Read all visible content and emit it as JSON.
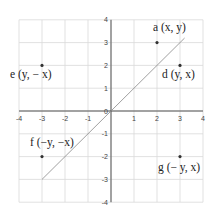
{
  "chart_data": {
    "type": "scatter",
    "title": "",
    "xlabel": "",
    "ylabel": "",
    "xlim": [
      -4,
      4
    ],
    "ylim": [
      -4,
      4
    ],
    "grid": true,
    "x_ticks": [
      "-4",
      "-3",
      "-2",
      "-1",
      "0",
      "1",
      "2",
      "3",
      "4"
    ],
    "y_ticks": [
      "4",
      "3",
      "2",
      "1",
      "0",
      "-1",
      "-2",
      "-3",
      "-4"
    ],
    "line": {
      "label": "y = x",
      "from": [
        -3,
        -3
      ],
      "to": [
        3.2,
        3.2
      ],
      "color": "#888888"
    },
    "points": [
      {
        "id": "a",
        "label": "a (x, y)",
        "x": 2,
        "y": 3
      },
      {
        "id": "d",
        "label": "d (y, x)",
        "x": 3,
        "y": 2
      },
      {
        "id": "e",
        "label": "e (y, − x)",
        "x": -3,
        "y": 2
      },
      {
        "id": "f",
        "label": "f (−y, −x)",
        "x": -3,
        "y": -2
      },
      {
        "id": "g",
        "label": "g (− y, x)",
        "x": 3,
        "y": -2
      }
    ],
    "colors": {
      "grid": "#d9d9d9",
      "axis": "#555555",
      "point": "#333333",
      "text": "#222222"
    }
  }
}
